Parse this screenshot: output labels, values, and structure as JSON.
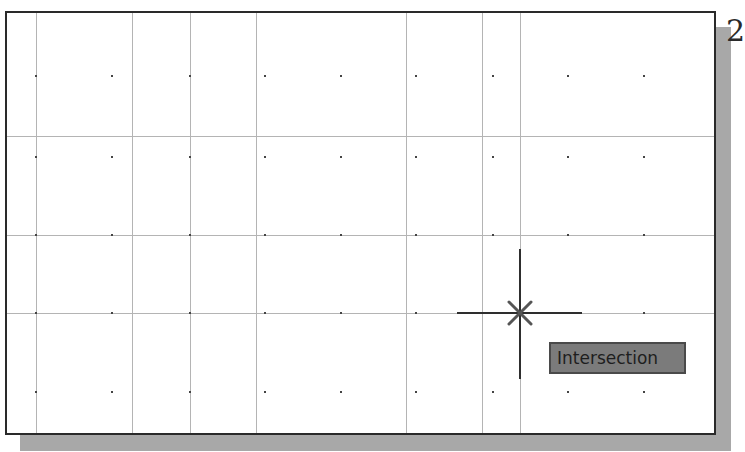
{
  "figure": {
    "step_number": "2"
  },
  "viewport": {
    "grid": {
      "vertical_lines_x": [
        29,
        125,
        183,
        249,
        399,
        475,
        513
      ],
      "horizontal_lines_y": [
        123,
        222,
        300
      ],
      "dot_columns_x": [
        29,
        105,
        183,
        258,
        334,
        409,
        486,
        561,
        637
      ],
      "dot_rows_y": [
        63,
        144,
        222,
        300,
        379
      ]
    },
    "cursor": {
      "x": 513,
      "y": 300,
      "snap_marker": "intersection-x-icon",
      "tooltip": "Intersection"
    }
  },
  "colors": {
    "grid_line": "#b4b4b4",
    "grid_dot": "#444444",
    "crosshair": "#2e2e2e",
    "tooltip_bg": "#7b7b7b",
    "tooltip_text": "#1e1e1e",
    "frame_border": "#2a2a2a",
    "shadow": "#a8a8a8"
  }
}
